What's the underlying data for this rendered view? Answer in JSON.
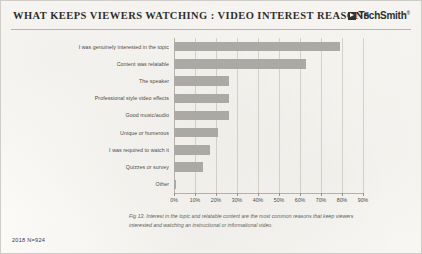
{
  "header": {
    "title": "WHAT KEEPS VIEWERS WATCHING : VIDEO INTEREST REASONS",
    "brand_name": "TechSmith",
    "brand_trademark": "®",
    "brand_mark_icon": "techsmith-logo-icon"
  },
  "footer": {
    "note": "2018 N=924"
  },
  "caption": {
    "text": "Fig 13. Interest in the topic and relatable content are the most common reasons that keep viewers interested and watching an instructional or informational video."
  },
  "colors": {
    "bar": "#a9a8a4",
    "gridline": "#d6d4ce",
    "axis": "#b4b1aa",
    "page_background": "#fbfaf7",
    "text": "#3a3937"
  },
  "chart_data": {
    "type": "bar",
    "orientation": "horizontal",
    "title": "WHAT KEEPS VIEWERS WATCHING : VIDEO INTEREST REASONS",
    "xlabel": "",
    "ylabel": "",
    "xlim": [
      0,
      90
    ],
    "xtick_labels": [
      "0%",
      "10%",
      "20%",
      "30%",
      "40%",
      "50%",
      "60%",
      "70%",
      "80%",
      "90%"
    ],
    "xtick_values": [
      0,
      10,
      20,
      30,
      40,
      50,
      60,
      70,
      80,
      90
    ],
    "grid": true,
    "legend": false,
    "units": "percent",
    "sample_size": "N=924",
    "year": "2018",
    "categories": [
      "I was genuinely interested in the topic",
      "Content was relatable",
      "The speaker",
      "Professional style video effects",
      "Good music/audio",
      "Unique or humerous",
      "I was required to watch it",
      "Quizzes or survey",
      "Other"
    ],
    "values": [
      79,
      63,
      26,
      26,
      26,
      21,
      17,
      14,
      1
    ]
  }
}
